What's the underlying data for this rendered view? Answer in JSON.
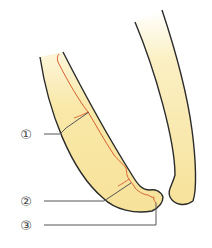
{
  "diagram": {
    "colors": {
      "tooth_fill": "#f8e6a0",
      "tooth_fill_light": "#fdf5d6",
      "outline": "#2b2b2b",
      "pulp_line": "#d9602f",
      "leader_line": "#555555",
      "label": "#444444"
    },
    "callouts": [
      {
        "id": "1",
        "label": "①"
      },
      {
        "id": "2",
        "label": "②"
      },
      {
        "id": "3",
        "label": "③"
      }
    ]
  }
}
